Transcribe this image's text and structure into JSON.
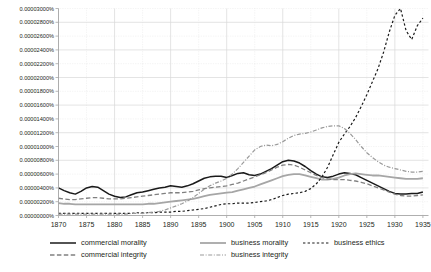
{
  "chart_data": {
    "type": "line",
    "title": "",
    "xlabel": "",
    "ylabel": "",
    "xlim": [
      1870,
      1936
    ],
    "ylim": [
      0,
      3e-05
    ],
    "grid": true,
    "legend_position": "bottom",
    "x_tick_labels": [
      "1870",
      "1875",
      "1880",
      "1885",
      "1890",
      "1895",
      "1900",
      "1905",
      "1910",
      "1915",
      "1920",
      "1925",
      "1930",
      "1935"
    ],
    "x_tick_values": [
      1870,
      1875,
      1880,
      1885,
      1890,
      1895,
      1900,
      1905,
      1910,
      1915,
      1920,
      1925,
      1930,
      1935
    ],
    "y_tick_labels": [
      "0.00000000%",
      "0.00000200%",
      "0.00000400%",
      "0.00000600%",
      "0.00000800%",
      "0.00001000%",
      "0.00001200%",
      "0.00001400%",
      "0.00001600%",
      "0.00001800%",
      "0.00002000%",
      "0.00002200%",
      "0.00002400%",
      "0.00002600%",
      "0.00002800%",
      "0.00003000%"
    ],
    "y_tick_values": [
      0,
      2e-06,
      4e-06,
      6e-06,
      8e-06,
      1e-05,
      1.2e-05,
      1.4e-05,
      1.6e-05,
      1.8e-05,
      2e-05,
      2.2e-05,
      2.4e-05,
      2.6e-05,
      2.8e-05,
      3e-05
    ],
    "x": [
      1870,
      1871,
      1872,
      1873,
      1874,
      1875,
      1876,
      1877,
      1878,
      1879,
      1880,
      1881,
      1882,
      1883,
      1884,
      1885,
      1886,
      1887,
      1888,
      1889,
      1890,
      1891,
      1892,
      1893,
      1894,
      1895,
      1896,
      1897,
      1898,
      1899,
      1900,
      1901,
      1902,
      1903,
      1904,
      1905,
      1906,
      1907,
      1908,
      1909,
      1910,
      1911,
      1912,
      1913,
      1914,
      1915,
      1916,
      1917,
      1918,
      1919,
      1920,
      1921,
      1922,
      1923,
      1924,
      1925,
      1926,
      1927,
      1928,
      1929,
      1930,
      1931,
      1932,
      1933,
      1934,
      1935
    ],
    "series": [
      {
        "name": "commercial morality",
        "color": "#1a1a1a",
        "width": 1.5,
        "dash": "none",
        "values": [
          4e-06,
          3.6e-06,
          3.3e-06,
          3.1e-06,
          3.5e-06,
          4e-06,
          4.2e-06,
          4.1e-06,
          3.6e-06,
          3.1e-06,
          2.8e-06,
          2.6e-06,
          2.7e-06,
          3e-06,
          3.3e-06,
          3.4e-06,
          3.6e-06,
          3.8e-06,
          4e-06,
          4.1e-06,
          4.3e-06,
          4.2e-06,
          4.1e-06,
          4.3e-06,
          4.6e-06,
          5e-06,
          5.4e-06,
          5.6e-06,
          5.7e-06,
          5.7e-06,
          5.5e-06,
          5.8e-06,
          6.1e-06,
          6.2e-06,
          5.9e-06,
          5.8e-06,
          6e-06,
          6.4e-06,
          6.8e-06,
          7.3e-06,
          7.8e-06,
          8e-06,
          7.9e-06,
          7.6e-06,
          7.1e-06,
          6.5e-06,
          6e-06,
          5.6e-06,
          5.5e-06,
          5.7e-06,
          6e-06,
          6.2e-06,
          6.1e-06,
          5.9e-06,
          5.5e-06,
          5.1e-06,
          4.7e-06,
          4.3e-06,
          3.9e-06,
          3.5e-06,
          3.2e-06,
          3.1e-06,
          3.1e-06,
          3.2e-06,
          3.2e-06,
          3.4e-06
        ]
      },
      {
        "name": "business morality",
        "color": "#a6a6a6",
        "width": 1.8,
        "dash": "none",
        "values": [
          1.8e-06,
          1.7e-06,
          1.7e-06,
          1.6e-06,
          1.6e-06,
          1.6e-06,
          1.6e-06,
          1.6e-06,
          1.6e-06,
          1.6e-06,
          1.6e-06,
          1.6e-06,
          1.6e-06,
          1.6e-06,
          1.6e-06,
          1.6e-06,
          1.7e-06,
          1.7e-06,
          1.8e-06,
          1.9e-06,
          2e-06,
          2.1e-06,
          2.2e-06,
          2.3e-06,
          2.4e-06,
          2.6e-06,
          2.8e-06,
          3e-06,
          3.1e-06,
          3.2e-06,
          3.3e-06,
          3.4e-06,
          3.6e-06,
          3.8e-06,
          4e-06,
          4.2e-06,
          4.5e-06,
          4.8e-06,
          5.1e-06,
          5.4e-06,
          5.7e-06,
          5.9e-06,
          6e-06,
          6e-06,
          5.8e-06,
          5.6e-06,
          5.4e-06,
          5.2e-06,
          5.2e-06,
          5.3e-06,
          5.5e-06,
          5.8e-06,
          6e-06,
          6.1e-06,
          6e-06,
          5.9e-06,
          5.8e-06,
          5.8e-06,
          5.7e-06,
          5.6e-06,
          5.5e-06,
          5.4e-06,
          5.3e-06,
          5.3e-06,
          5.3e-06,
          5.4e-06
        ]
      },
      {
        "name": "business ethics",
        "color": "#1a1a1a",
        "width": 1.2,
        "dash": "2.4 2.2",
        "values": [
          3e-07,
          3e-07,
          3e-07,
          3e-07,
          3e-07,
          3e-07,
          3e-07,
          3e-07,
          3e-07,
          3e-07,
          3e-07,
          3e-07,
          3e-07,
          3e-07,
          4e-07,
          4e-07,
          4e-07,
          4e-07,
          5e-07,
          5e-07,
          5e-07,
          6e-07,
          6e-07,
          7e-07,
          8e-07,
          9e-07,
          1e-06,
          1.2e-06,
          1.4e-06,
          1.6e-06,
          1.7e-06,
          1.7e-06,
          1.8e-06,
          1.8e-06,
          1.8e-06,
          1.9e-06,
          2e-06,
          2.1e-06,
          2.3e-06,
          2.6e-06,
          2.9e-06,
          3.1e-06,
          3.2e-06,
          3.3e-06,
          3.5e-06,
          3.9e-06,
          4.6e-06,
          5.6e-06,
          7e-06,
          8.8e-06,
          1.06e-05,
          1.18e-05,
          1.29e-05,
          1.42e-05,
          1.58e-05,
          1.75e-05,
          1.94e-05,
          2.13e-05,
          2.37e-05,
          2.66e-05,
          2.9e-05,
          3e-05,
          2.68e-05,
          2.55e-05,
          2.75e-05,
          2.86e-05
        ]
      },
      {
        "name": "commercial integrity",
        "color": "#808080",
        "width": 1.3,
        "dash": "4.5 2.4",
        "values": [
          2.5e-06,
          2.4e-06,
          2.3e-06,
          2.3e-06,
          2.4e-06,
          2.5e-06,
          2.6e-06,
          2.6e-06,
          2.5e-06,
          2.4e-06,
          2.4e-06,
          2.4e-06,
          2.5e-06,
          2.6e-06,
          2.7e-06,
          2.8e-06,
          2.9e-06,
          3e-06,
          3.1e-06,
          3.2e-06,
          3.3e-06,
          3.3e-06,
          3.3e-06,
          3.4e-06,
          3.5e-06,
          3.7e-06,
          3.9e-06,
          4e-06,
          4.1e-06,
          4.2e-06,
          4.3e-06,
          4.5e-06,
          4.7e-06,
          5e-06,
          5.3e-06,
          5.6e-06,
          5.9e-06,
          6.2e-06,
          6.6e-06,
          7e-06,
          7.3e-06,
          7.4e-06,
          7.3e-06,
          7e-06,
          6.6e-06,
          6.2e-06,
          5.8e-06,
          5.5e-06,
          5.3e-06,
          5.2e-06,
          5.2e-06,
          5.2e-06,
          5.1e-06,
          5e-06,
          4.8e-06,
          4.6e-06,
          4.3e-06,
          4e-06,
          3.7e-06,
          3.4e-06,
          3.1e-06,
          2.9e-06,
          2.8e-06,
          2.8e-06,
          2.9e-06,
          3e-06
        ]
      },
      {
        "name": "business integrity",
        "color": "#999999",
        "width": 1.2,
        "dash": "4 1.6 1 1.6",
        "values": [
          2e-07,
          2e-07,
          2e-07,
          2e-07,
          2e-07,
          2e-07,
          2e-07,
          2e-07,
          2e-07,
          2e-07,
          2e-07,
          2e-07,
          2e-07,
          3e-07,
          3e-07,
          3e-07,
          4e-07,
          5e-07,
          6e-07,
          8e-07,
          1.1e-06,
          1.4e-06,
          1.7e-06,
          2.1e-06,
          2.6e-06,
          3.2e-06,
          3.8e-06,
          4.3e-06,
          4.7e-06,
          5e-06,
          5.4e-06,
          6e-06,
          6.8e-06,
          7.7e-06,
          8.6e-06,
          9.5e-06,
          1e-05,
          1.02e-05,
          1.01e-05,
          1.03e-05,
          1.07e-05,
          1.12e-05,
          1.16e-05,
          1.18e-05,
          1.19e-05,
          1.21e-05,
          1.24e-05,
          1.27e-05,
          1.29e-05,
          1.3e-05,
          1.3e-05,
          1.26e-05,
          1.19e-05,
          1.1e-05,
          1e-05,
          9.1e-06,
          8.4e-06,
          7.8e-06,
          7.3e-06,
          7e-06,
          6.8e-06,
          6.6e-06,
          6.4e-06,
          6.3e-06,
          6.3e-06,
          6.4e-06
        ]
      }
    ],
    "legend": [
      {
        "label": "commercial morality",
        "style": "solid-black"
      },
      {
        "label": "business morality",
        "style": "solid-gray"
      },
      {
        "label": "business ethics",
        "style": "dotted-black"
      },
      {
        "label": "commercial integrity",
        "style": "dashed-gray"
      },
      {
        "label": "business integrity",
        "style": "dashdot-gray"
      }
    ],
    "caption": ""
  }
}
